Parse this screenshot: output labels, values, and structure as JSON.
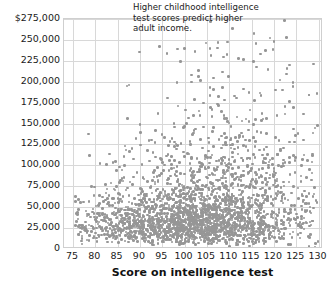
{
  "chart_data": {
    "type": "scatter",
    "title": "",
    "xlabel": "Score on intelligence test",
    "ylabel": "",
    "xlim": [
      73,
      131
    ],
    "ylim": [
      0,
      275000
    ],
    "grid": true,
    "legend": "none",
    "marker_color": "#969696",
    "gridline_color": "#d8d8d8",
    "x_ticks": [
      75,
      80,
      85,
      90,
      95,
      100,
      105,
      110,
      115,
      120,
      125,
      130
    ],
    "x_tick_labels": [
      "75",
      "80",
      "85",
      "90",
      "95",
      "100",
      "105",
      "110",
      "115",
      "120",
      "125",
      "130"
    ],
    "y_ticks": [
      0,
      25000,
      50000,
      75000,
      100000,
      125000,
      150000,
      175000,
      200000,
      225000,
      250000,
      275000
    ],
    "y_tick_labels": [
      "0",
      "25,000",
      "50,000",
      "75,000",
      "100,000",
      "125,000",
      "150,000",
      "175,000",
      "200,000",
      "225,000",
      "250,000",
      "$275,000"
    ],
    "annotation_lines": [
      "Higher childhood intelligence",
      "test scores predict higher",
      "adult income."
    ],
    "annotation_text": "Higher childhood intelligence test scores predict higher adult income.",
    "n_points": 2600,
    "distribution": {
      "x_mean": 104,
      "x_sd": 13,
      "x_min": 75,
      "x_max": 130,
      "income_median_at_x75": 30000,
      "income_median_at_x130": 55000,
      "income_spread_growth": "increasing with score"
    }
  }
}
